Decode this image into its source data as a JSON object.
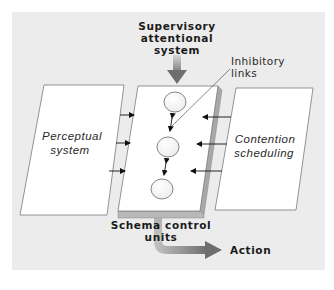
{
  "diagram": {
    "labels": {
      "sas_line1": "Supervisory",
      "sas_line2": "attentional",
      "sas_line3": "system",
      "inhibitory_line1": "Inhibitory",
      "inhibitory_line2": "links",
      "perceptual_line1": "Perceptual",
      "perceptual_line2": "system",
      "contention_line1": "Contention",
      "contention_line2": "scheduling",
      "schema_line1": "Schema control",
      "schema_line2": "units",
      "action": "Action"
    },
    "nodes": [
      {
        "id": "perceptual-system",
        "label": "Perceptual system",
        "shape": "parallelogram"
      },
      {
        "id": "schema-control-units",
        "label": "Schema control units",
        "shape": "slab",
        "units": 3
      },
      {
        "id": "contention-scheduling",
        "label": "Contention scheduling",
        "shape": "parallelogram"
      },
      {
        "id": "supervisory-attentional-system",
        "label": "Supervisory attentional system",
        "shape": "text"
      },
      {
        "id": "action",
        "label": "Action",
        "shape": "text"
      }
    ],
    "edges": [
      {
        "from": "perceptual-system",
        "to": "schema-control-units",
        "count": 3
      },
      {
        "from": "contention-scheduling",
        "to": "schema-control-units",
        "count": 3
      },
      {
        "from": "supervisory-attentional-system",
        "to": "schema-control-units",
        "style": "thick-gradient-arrow"
      },
      {
        "from": "schema-control-units",
        "to": "action",
        "style": "thick-gradient-arrow"
      },
      {
        "from": "unit-1",
        "to": "unit-2",
        "style": "bidirectional",
        "label": "Inhibitory links"
      },
      {
        "from": "unit-2",
        "to": "unit-3",
        "style": "bidirectional"
      }
    ],
    "colors": {
      "page_bg": "#ffffff",
      "panel_bg": "#ececec",
      "box_fill": "#ffffff",
      "box_stroke": "#777777",
      "arrow_dark": "#7a7a7a",
      "arrow_light": "#c8c8c8",
      "text": "#1a1a1a"
    }
  }
}
